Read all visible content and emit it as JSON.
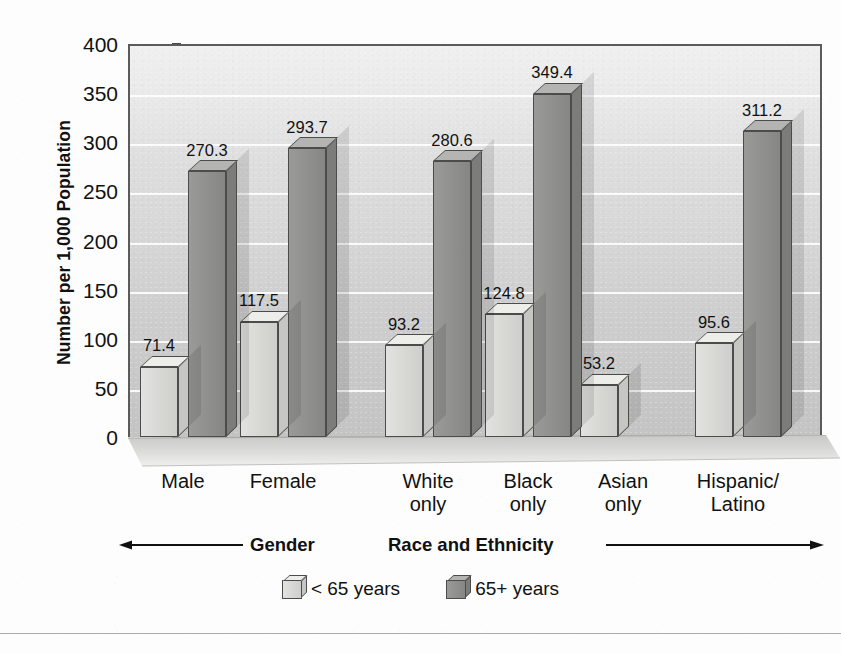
{
  "chart_data": {
    "type": "bar",
    "title": "",
    "xlabel": "",
    "ylabel": "Number per 1,000 Population",
    "ylim": [
      0,
      400
    ],
    "yticks": [
      0,
      50,
      100,
      150,
      200,
      250,
      300,
      350,
      400
    ],
    "ytick_labels": [
      "0",
      "50",
      "100",
      "150",
      "200",
      "250",
      "300",
      "350",
      "400"
    ],
    "grid": true,
    "legend_position": "bottom-center",
    "categories": [
      "Male",
      "Female",
      "White only",
      "Black only",
      "Asian only",
      "Hispanic/ Latino"
    ],
    "category_labels": [
      [
        "Male"
      ],
      [
        "Female"
      ],
      [
        "White",
        "only"
      ],
      [
        "Black",
        "only"
      ],
      [
        "Asian",
        "only"
      ],
      [
        "Hispanic/",
        "Latino"
      ]
    ],
    "series": [
      {
        "name": "< 65 years",
        "color": "#d6d6d3",
        "values": [
          71.4,
          117.5,
          93.2,
          124.8,
          53.2,
          95.6
        ]
      },
      {
        "name": "65+ years",
        "color": "#919190",
        "values": [
          270.3,
          293.7,
          280.6,
          349.4,
          null,
          311.2
        ]
      }
    ],
    "value_labels": {
      "male_under65": "71.4",
      "male_65plus": "270.3",
      "female_under65": "117.5",
      "female_65plus": "293.7",
      "white_under65": "93.2",
      "white_65plus": "280.6",
      "black_under65": "124.8",
      "black_65plus": "349.4",
      "asian_under65": "53.2",
      "hispanic_under65": "95.6",
      "hispanic_65plus": "311.2"
    },
    "groups": [
      {
        "name": "Gender",
        "categories": [
          "Male",
          "Female"
        ]
      },
      {
        "name": "Race and Ethnicity",
        "categories": [
          "White only",
          "Black only",
          "Asian only",
          "Hispanic/Latino"
        ]
      }
    ]
  },
  "axis": {
    "y_title": "Number per 1,000 Population"
  },
  "legend": {
    "items": [
      {
        "label": "< 65 years",
        "style": "light"
      },
      {
        "label": "65+ years",
        "style": "dark"
      }
    ]
  },
  "groups": {
    "gender_label": "Gender",
    "race_label": "Race and Ethnicity"
  }
}
